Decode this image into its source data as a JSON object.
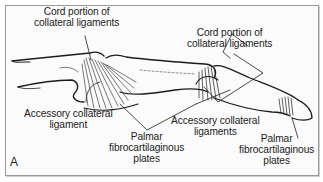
{
  "figure": {
    "panel_label": "A",
    "labels": {
      "cord_mcp": {
        "line1": "Cord portion of",
        "line2": "collateral ligaments"
      },
      "cord_ip": {
        "line1": "Cord portion of",
        "line2": "collateral ligaments"
      },
      "accessory_mcp": {
        "line1": "Accessory collateral",
        "line2": "ligament"
      },
      "accessory_ip": {
        "line1": "Accessory collateral",
        "line2": "ligaments"
      },
      "palmar_mcp": {
        "line1": "Palmar",
        "line2": "fibrocartilaginous",
        "line3": "plates"
      },
      "palmar_ip": {
        "line1": "Palmar",
        "line2": "fibrocartilaginous",
        "line3": "plates"
      }
    },
    "colors": {
      "ink": "#1c1c1c",
      "frame": "#9a9a9a",
      "background": "#fbfbfb"
    }
  }
}
